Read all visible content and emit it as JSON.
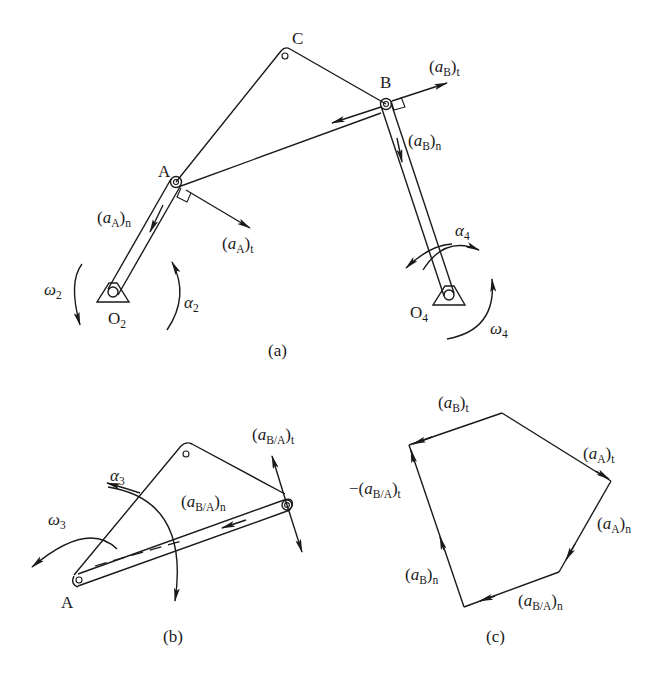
{
  "figure": {
    "panels": [
      {
        "id": "a",
        "caption": "(a)",
        "points": {
          "C": "C",
          "B": "B",
          "A": "A",
          "O2": {
            "base": "O",
            "sub": "2"
          },
          "O4": {
            "base": "O",
            "sub": "4"
          }
        },
        "vectors": {
          "aB_t": {
            "var": "a",
            "sub": "B",
            "suffix": "t"
          },
          "aB_n": {
            "var": "a",
            "sub": "B",
            "suffix": "n"
          },
          "aA_n": {
            "var": "a",
            "sub": "A",
            "suffix": "n"
          },
          "aA_t": {
            "var": "a",
            "sub": "A",
            "suffix": "t"
          }
        },
        "angular": {
          "omega2": {
            "var": "ω",
            "sub": "2"
          },
          "alpha2": {
            "var": "α",
            "sub": "2"
          },
          "alpha4": {
            "var": "α",
            "sub": "4"
          },
          "omega4": {
            "var": "ω",
            "sub": "4"
          }
        }
      },
      {
        "id": "b",
        "caption": "(b)",
        "points": {
          "A": "A"
        },
        "vectors": {
          "aBA_t": {
            "var": "a",
            "sub": "B/A",
            "suffix": "t"
          },
          "aBA_n": {
            "var": "a",
            "sub": "B/A",
            "suffix": "n"
          }
        },
        "angular": {
          "alpha3": {
            "var": "α",
            "sub": "3"
          },
          "omega3": {
            "var": "ω",
            "sub": "3"
          }
        }
      },
      {
        "id": "c",
        "caption": "(c)",
        "vectors": {
          "aB_t": {
            "var": "a",
            "sub": "B",
            "suffix": "t"
          },
          "neg_aBA_t": {
            "prefix": "−",
            "var": "a",
            "sub": "B/A",
            "suffix": "t"
          },
          "aA_t": {
            "var": "a",
            "sub": "A",
            "suffix": "t"
          },
          "aA_n": {
            "var": "a",
            "sub": "A",
            "suffix": "n"
          },
          "aB_n": {
            "var": "a",
            "sub": "B",
            "suffix": "n"
          },
          "aBA_n": {
            "var": "a",
            "sub": "B/A",
            "suffix": "n"
          }
        }
      }
    ]
  }
}
